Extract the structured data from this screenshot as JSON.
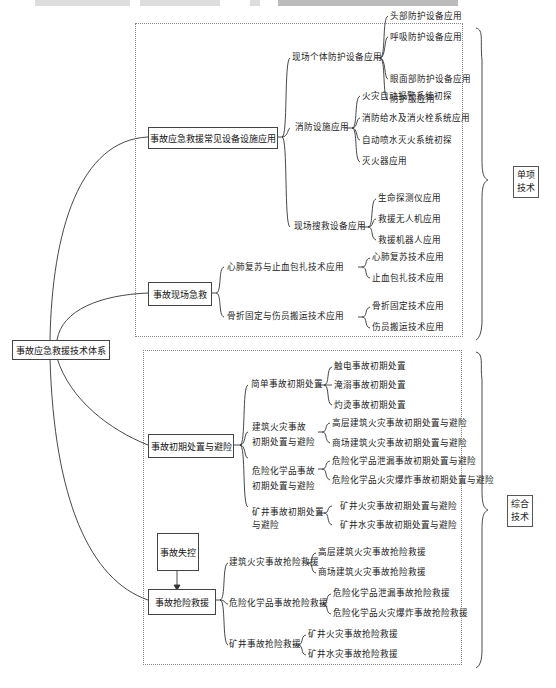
{
  "root": "事故应急救援技术体系",
  "single_group": {
    "label_line1": "单项",
    "label_line2": "技术",
    "sections": [
      {
        "title": "事故应急救援常见设备设施应用",
        "branches": [
          {
            "label": "现场个体防护设备应用",
            "leaves": [
              "头部防护设备应用",
              "呼吸防护设备应用",
              "眼面部防护设备应用",
              "防护服应用"
            ]
          },
          {
            "label": "消防设施应用",
            "leaves": [
              "火灾自动报警系统初探",
              "消防给水及消火栓系统应用",
              "自动喷水灭火系统初探",
              "灭火器应用"
            ]
          },
          {
            "label": "现场搜救设备应用",
            "leaves": [
              "生命探测仪应用",
              "救援无人机应用",
              "救援机器人应用"
            ]
          }
        ]
      },
      {
        "title": "事故现场急救",
        "branches": [
          {
            "label": "心肺复苏与止血包扎技术应用",
            "leaves": [
              "心肺复苏技术应用",
              "止血包扎技术应用"
            ]
          },
          {
            "label": "骨折固定与伤员搬运技术应用",
            "leaves": [
              "骨折固定技术应用",
              "伤员搬运技术应用"
            ]
          }
        ]
      }
    ]
  },
  "combined_group": {
    "label_line1": "综合",
    "label_line2": "技术",
    "sections": [
      {
        "title": "事故初期处置与避险",
        "branches": [
          {
            "label": "简单事故初期处置",
            "leaves": [
              "触电事故初期处置",
              "淹溺事故初期处置",
              "灼烫事故初期处置"
            ]
          },
          {
            "label_line1": "建筑火灾事故",
            "label_line2": "初期处置与避险",
            "leaves": [
              "高层建筑火灾事故初期处置与避险",
              "商场建筑火灾事故初期处置与避险"
            ]
          },
          {
            "label_line1": "危险化学品事故",
            "label_line2": "初期处置与避险",
            "leaves": [
              "危险化学品泄漏事故初期处置与避险",
              "危险化学品火灾爆炸事故初期处置与避险"
            ]
          },
          {
            "label_line1": "矿井事故初期处置",
            "label_line2": "与避险",
            "leaves": [
              "矿井火灾事故初期处置与避险",
              "矿井水灾事故初期处置与避险"
            ]
          }
        ]
      },
      {
        "trigger": "事故失控",
        "title": "事故抢险救援",
        "branches": [
          {
            "label": "建筑火灾事故抢险救援",
            "leaves": [
              "高层建筑火灾事故抢险救援",
              "商场建筑火灾事故抢险救援"
            ]
          },
          {
            "label": "危险化学品事故抢险救援",
            "leaves": [
              "危险化学品泄漏事故抢险救援",
              "危险化学品火灾爆炸事故抢险救援"
            ]
          },
          {
            "label": "矿井事故抢险救援",
            "leaves": [
              "矿井火灾事故抢险救援",
              "矿井水灾事故抢险救援"
            ]
          }
        ]
      }
    ]
  }
}
